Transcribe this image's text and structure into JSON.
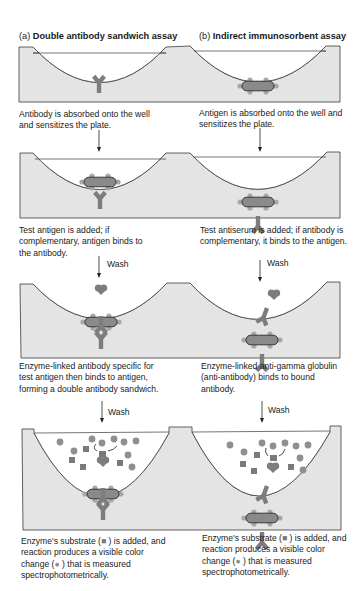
{
  "figure": {
    "panel_a": {
      "label": "(a)",
      "title": "Double antibody sandwich assay",
      "steps": [
        {
          "caption": "Antibody is absorbed onto the well and sensitizes the plate."
        },
        {
          "caption": "Test antigen is added; if complementary, antigen binds to the antibody.",
          "arrow_label": ""
        },
        {
          "caption": "Enzyme-linked antibody specific for test antigen then binds to antigen, forming a double antibody sandwich.",
          "arrow_label": "Wash"
        },
        {
          "caption": "Enzyme's substrate (■) is added, and reaction produces a visible color change (●) that is measured spectrophotometrically.",
          "arrow_label": "Wash"
        }
      ]
    },
    "panel_b": {
      "label": "(b)",
      "title": "Indirect immunosorbent assay",
      "steps": [
        {
          "caption": "Antigen is absorbed onto the well and sensitizes the plate."
        },
        {
          "caption": "Test antiserum is added; if antibody is complementary, it binds to the antigen.",
          "arrow_label": ""
        },
        {
          "caption": "Enzyme-linked anti-gamma globulin (anti-antibody) binds to bound antibody.",
          "arrow_label": "Wash"
        },
        {
          "caption": "Enzyme's substrate (■) is added, and reaction produces a visible color change (●) that is measured spectrophotometrically.",
          "arrow_label": "Wash"
        }
      ]
    },
    "captions": {
      "a1": "Antibody is absorbed onto the well and sensitizes the plate.",
      "a2": "Test antigen is added; if complementary, antigen binds to the antibody.",
      "a3": "Enzyme-linked antibody specific for test antigen then binds to antigen, forming a double antibody sandwich.",
      "a4_pre": "Enzyme's substrate (",
      "a4_mid": " ) is added, and reaction produces a visible color change (",
      "a4_post": " ) that is measured spectrophotometrically.",
      "b1": "Antigen is absorbed onto the well and sensitizes the plate.",
      "b2": "Test antiserum is added; if antibody is complementary, it binds to the antigen.",
      "b3": "Enzyme-linked anti-gamma globulin (anti-antibody) binds to bound antibody.",
      "b4_pre": "Enzyme's substrate (",
      "b4_mid": " ) is added, and reaction produces a visible color change (",
      "b4_post": " ) that is measured spectrophotometrically."
    },
    "wash_label": "Wash",
    "legend": {
      "substrate_symbol": "■",
      "color_change_symbol": "●"
    },
    "colors": {
      "plate": "#e4e4e4",
      "outline": "#3a3a3a",
      "antibody": "#7d7d7d",
      "antigen_body": "#8a8a8a",
      "antigen_bumps": "#a8a8a8",
      "substrate": "#7a7a7a",
      "product": "#8f8f8f"
    }
  }
}
